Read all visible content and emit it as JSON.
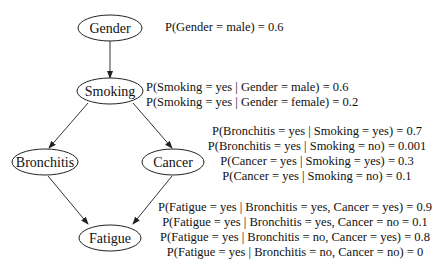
{
  "diagram": {
    "type": "bayesian-network",
    "nodes": [
      {
        "id": "gender",
        "label": "Gender"
      },
      {
        "id": "smoking",
        "label": "Smoking"
      },
      {
        "id": "bronchitis",
        "label": "Bronchitis"
      },
      {
        "id": "cancer",
        "label": "Cancer"
      },
      {
        "id": "fatigue",
        "label": "Fatigue"
      }
    ],
    "edges": [
      {
        "from": "Gender",
        "to": "Smoking"
      },
      {
        "from": "Smoking",
        "to": "Bronchitis"
      },
      {
        "from": "Smoking",
        "to": "Cancer"
      },
      {
        "from": "Bronchitis",
        "to": "Fatigue"
      },
      {
        "from": "Cancer",
        "to": "Fatigue"
      }
    ],
    "probabilities": {
      "gender": [
        "P(Gender = male) = 0.6"
      ],
      "smoking": [
        "P(Smoking = yes | Gender = male) = 0.6",
        "P(Smoking = yes | Gender = female) = 0.2"
      ],
      "bronchitis_cancer": [
        "P(Bronchitis = yes | Smoking = yes) = 0.7",
        "P(Bronchitis = yes | Smoking = no) = 0.001",
        "P(Cancer = yes | Smoking = yes) = 0.3",
        "P(Cancer = yes | Smoking = no) = 0.1"
      ],
      "fatigue": [
        "P(Fatigue = yes | Bronchitis = yes, Cancer = yes) = 0.9",
        "P(Fatigue = yes | Bronchitis = yes, Cancer = no = 0.1",
        "P(Fatigue = yes | Bronchitis = no, Cancer = yes) = 0.8",
        "P(Fatigue = yes | Bronchitis = no, Cancer = no) = 0"
      ]
    }
  }
}
